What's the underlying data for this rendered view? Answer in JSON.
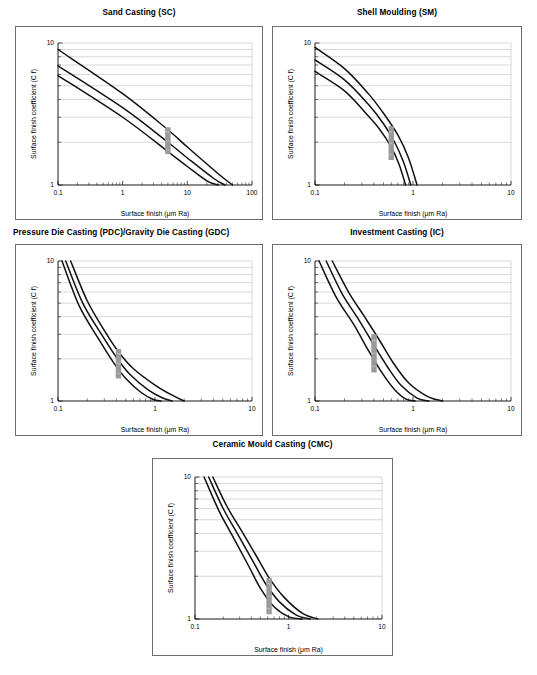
{
  "figure": {
    "background": "#ffffff",
    "curve_color": "#111111",
    "grid_color": "#bdbdbd",
    "marker_color": "#9a9a9a",
    "panel_border_color": "#6e6e6e"
  },
  "common": {
    "xlabel": "Surface finish (μm Ra)",
    "ylabel": "Surface finish coefficient (C f)",
    "ylim": [
      1,
      10
    ],
    "ytick_labels": [
      "1",
      "10"
    ],
    "grid": "horizontal-minor-log"
  },
  "chart_data": [
    {
      "id": "sand-casting",
      "type": "line",
      "title": "Sand Casting (SC)",
      "xlabel": "Surface finish (μm Ra)",
      "ylabel": "Surface finish coefficient (C f)",
      "xlim": [
        0.1,
        100
      ],
      "ylim": [
        1,
        10
      ],
      "xtick_labels": [
        "0.1",
        "1",
        "10",
        "100"
      ],
      "ytick_labels": [
        "1",
        "10"
      ],
      "series": [
        {
          "name": "upper",
          "x": [
            0.1,
            1.0,
            5.0,
            10.0,
            30.0,
            50.0
          ],
          "y": [
            9.0,
            4.4,
            2.45,
            1.85,
            1.2,
            1.0
          ]
        },
        {
          "name": "middle",
          "x": [
            0.1,
            1.0,
            5.0,
            10.0,
            25.0,
            38.0
          ],
          "y": [
            6.9,
            3.5,
            2.0,
            1.55,
            1.12,
            1.0
          ]
        },
        {
          "name": "lower",
          "x": [
            0.1,
            1.0,
            5.0,
            10.0,
            20.0,
            30.0
          ],
          "y": [
            5.9,
            3.0,
            1.72,
            1.35,
            1.07,
            1.0
          ]
        }
      ],
      "marker": {
        "x": 5.0,
        "y_low": 1.65,
        "y_high": 2.55,
        "labels": [
          "3",
          "2",
          "1"
        ]
      }
    },
    {
      "id": "shell-moulding",
      "type": "line",
      "title": "Shell Moulding (SM)",
      "xlabel": "Surface finish (μm Ra)",
      "ylabel": "Surface finish coefficient (C f)",
      "xlim": [
        0.1,
        10
      ],
      "ylim": [
        1,
        10
      ],
      "xtick_labels": [
        "0.1",
        "1",
        "10"
      ],
      "ytick_labels": [
        "1",
        "10"
      ],
      "series": [
        {
          "name": "upper",
          "x": [
            0.1,
            0.2,
            0.35,
            0.5,
            0.7,
            0.9,
            1.1
          ],
          "y": [
            9.3,
            6.6,
            4.4,
            3.2,
            2.25,
            1.55,
            1.0
          ]
        },
        {
          "name": "middle",
          "x": [
            0.1,
            0.2,
            0.35,
            0.5,
            0.65,
            0.8,
            0.95
          ],
          "y": [
            7.6,
            5.5,
            3.7,
            2.7,
            2.0,
            1.45,
            1.0
          ]
        },
        {
          "name": "lower",
          "x": [
            0.1,
            0.2,
            0.33,
            0.45,
            0.6,
            0.72,
            0.84
          ],
          "y": [
            6.3,
            4.6,
            3.2,
            2.5,
            1.85,
            1.4,
            1.0
          ]
        }
      ],
      "marker": {
        "x": 0.6,
        "y_low": 1.5,
        "y_high": 2.6,
        "labels": [
          "3",
          "2",
          "1"
        ]
      }
    },
    {
      "id": "pressure-gravity-die-casting",
      "type": "line",
      "title": "Pressure Die Casting (PDC)/Gravity Die Casting (GDC)",
      "xlabel": "Surface finish (μm Ra)",
      "ylabel": "Surface finish coefficient (C f)",
      "xlim": [
        0.1,
        10
      ],
      "ylim": [
        1,
        10
      ],
      "xtick_labels": [
        "0.1",
        "1",
        "10"
      ],
      "ytick_labels": [
        "1",
        "10"
      ],
      "series": [
        {
          "name": "upper",
          "x": [
            0.135,
            0.2,
            0.3,
            0.42,
            0.6,
            1.0,
            1.5,
            2.0
          ],
          "y": [
            10.0,
            5.2,
            3.2,
            2.25,
            1.7,
            1.3,
            1.1,
            1.0
          ]
        },
        {
          "name": "middle",
          "x": [
            0.12,
            0.18,
            0.28,
            0.4,
            0.55,
            0.85,
            1.2,
            1.5
          ],
          "y": [
            10.0,
            5.0,
            3.0,
            2.05,
            1.55,
            1.2,
            1.05,
            1.0
          ]
        },
        {
          "name": "lower",
          "x": [
            0.11,
            0.165,
            0.26,
            0.38,
            0.5,
            0.72,
            0.95,
            1.15
          ],
          "y": [
            10.0,
            4.8,
            2.8,
            1.85,
            1.45,
            1.15,
            1.03,
            1.0
          ]
        }
      ],
      "marker": {
        "x": 0.42,
        "y_low": 1.45,
        "y_high": 2.35,
        "labels": [
          "3",
          "2",
          "1"
        ]
      }
    },
    {
      "id": "investment-casting",
      "type": "line",
      "title": "Investment Casting (IC)",
      "xlabel": "Surface finish (μm Ra)",
      "ylabel": "Surface finish coefficient (C f)",
      "xlim": [
        0.1,
        10
      ],
      "ylim": [
        1,
        10
      ],
      "xtick_labels": [
        "0.1",
        "1",
        "10"
      ],
      "ytick_labels": [
        "1",
        "10"
      ],
      "series": [
        {
          "name": "upper",
          "x": [
            0.15,
            0.22,
            0.32,
            0.45,
            0.62,
            0.9,
            1.4,
            2.0
          ],
          "y": [
            10.0,
            6.0,
            4.0,
            2.75,
            1.9,
            1.35,
            1.08,
            1.0
          ]
        },
        {
          "name": "middle",
          "x": [
            0.13,
            0.19,
            0.28,
            0.4,
            0.55,
            0.75,
            1.1,
            1.45
          ],
          "y": [
            10.0,
            5.8,
            3.8,
            2.5,
            1.75,
            1.3,
            1.05,
            1.0
          ]
        },
        {
          "name": "lower",
          "x": [
            0.11,
            0.165,
            0.25,
            0.35,
            0.48,
            0.64,
            0.85,
            1.05
          ],
          "y": [
            10.0,
            5.5,
            3.5,
            2.3,
            1.6,
            1.22,
            1.03,
            1.0
          ]
        }
      ],
      "marker": {
        "x": 0.4,
        "y_low": 1.6,
        "y_high": 3.0,
        "labels": [
          "3",
          "2",
          "1"
        ]
      }
    },
    {
      "id": "ceramic-mould-casting",
      "type": "line",
      "title": "Ceramic Mould Casting (CMC)",
      "xlabel": "Surface finish (μm Ra)",
      "ylabel": "Surface finish coefficient (C f)",
      "xlim": [
        0.1,
        10
      ],
      "ylim": [
        1,
        10
      ],
      "xtick_labels": [
        "0.1",
        "1",
        "10"
      ],
      "ytick_labels": [
        "1",
        "10"
      ],
      "series": [
        {
          "name": "upper",
          "x": [
            0.155,
            0.22,
            0.32,
            0.45,
            0.62,
            0.9,
            1.4,
            2.05
          ],
          "y": [
            10.0,
            6.2,
            4.1,
            2.8,
            1.95,
            1.42,
            1.1,
            1.0
          ]
        },
        {
          "name": "middle",
          "x": [
            0.14,
            0.2,
            0.29,
            0.41,
            0.56,
            0.8,
            1.2,
            1.7
          ],
          "y": [
            10.0,
            6.0,
            3.9,
            2.6,
            1.8,
            1.32,
            1.07,
            1.0
          ]
        },
        {
          "name": "lower",
          "x": [
            0.125,
            0.18,
            0.26,
            0.37,
            0.5,
            0.7,
            1.0,
            1.4
          ],
          "y": [
            10.0,
            5.8,
            3.7,
            2.4,
            1.65,
            1.22,
            1.04,
            1.0
          ]
        }
      ],
      "marker": {
        "x": 0.62,
        "y_low": 1.08,
        "y_high": 1.95,
        "labels": [
          "3",
          "2",
          "1"
        ]
      }
    }
  ]
}
